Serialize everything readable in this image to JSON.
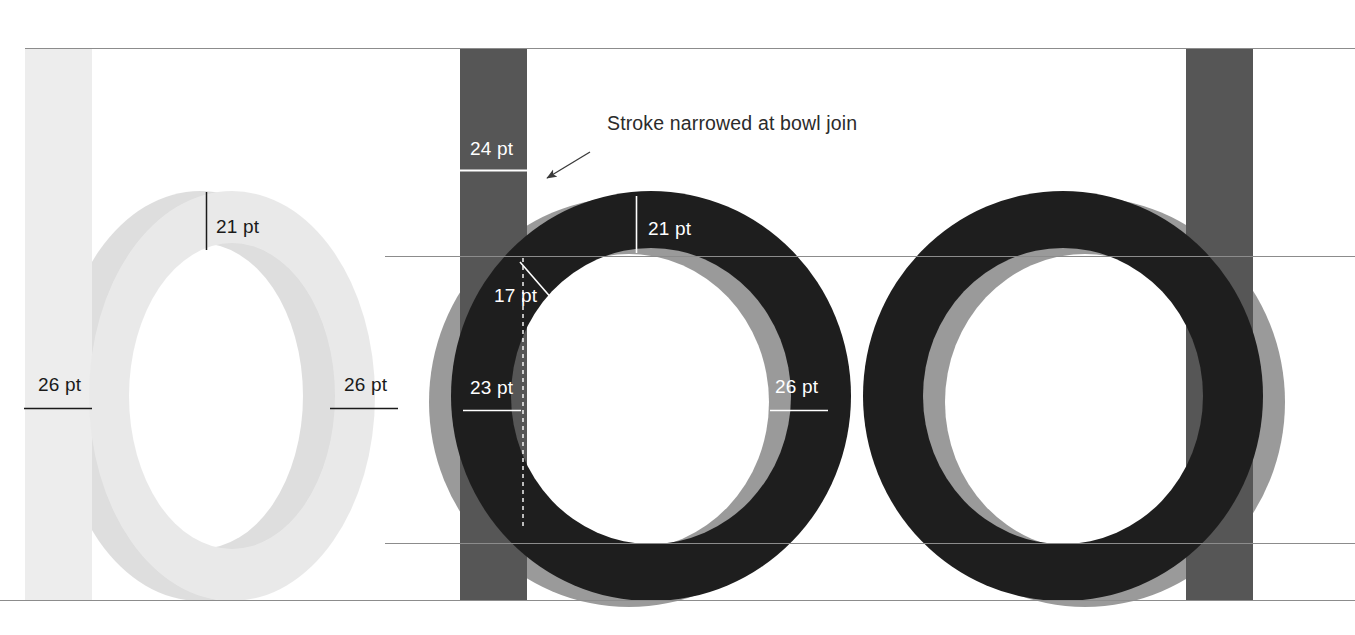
{
  "figure": {
    "background": "#ffffff"
  },
  "colors": {
    "page_background": "#ffffff",
    "light_letter": "#e9e9e9",
    "light_letter_ghost": "#dedede",
    "dark_letter": "#1e1e1e",
    "dark_letter_ghost": "#9a9a9a",
    "bar_light": "#ededed",
    "bar_dark": "#565656",
    "guideline": "#8c8c8c",
    "label_dark": "#1a1a1a",
    "label_light": "#ffffff",
    "annotation_text": "#2b2b2b",
    "annotation_arrow": "#3a3a3a"
  },
  "guidelines": [
    {
      "name": "cap-line",
      "y": 48,
      "x1": 25,
      "x2": 1355
    },
    {
      "name": "x-height-line",
      "y": 256,
      "x1": 385,
      "x2": 1355
    },
    {
      "name": "baseline",
      "y": 543,
      "x1": 385,
      "x2": 1355
    },
    {
      "name": "descender-line",
      "y": 600,
      "x1": 0,
      "x2": 1355
    }
  ],
  "vertical_bars": [
    {
      "name": "stem-bar-left",
      "x": 25,
      "width": 67,
      "y": 48,
      "height": 552,
      "tone": "light"
    },
    {
      "name": "stem-bar-middle",
      "x": 460,
      "width": 67,
      "y": 48,
      "height": 552,
      "tone": "dark"
    },
    {
      "name": "stem-bar-right",
      "x": 1186,
      "width": 67,
      "y": 48,
      "height": 552,
      "tone": "dark"
    }
  ],
  "letterforms": [
    {
      "name": "letter-o-light",
      "tone": "light",
      "cx": 232,
      "cy": 396,
      "rx_outer": 143,
      "ry_outer": 205,
      "rx_inner": 103,
      "ry_inner": 153,
      "ghost_dx": -32,
      "ghost_dy": 0,
      "has_ghost": true
    },
    {
      "name": "letter-o-dark-measured",
      "tone": "dark",
      "cx": 651,
      "cy": 396,
      "rx_outer": 200,
      "ry_outer": 205,
      "rx_inner": 140,
      "ry_inner": 148,
      "ghost_dx": -22,
      "ghost_dy": 6,
      "has_ghost": true
    },
    {
      "name": "letter-o-dark-plain",
      "tone": "dark",
      "cx": 1063,
      "cy": 396,
      "rx_outer": 200,
      "ry_outer": 205,
      "rx_inner": 140,
      "ry_inner": 148,
      "ghost_dx": 22,
      "ghost_dy": 6,
      "has_ghost": true
    }
  ],
  "measurements": [
    {
      "name": "measure-light-top",
      "value": "21 pt",
      "tone": "dark",
      "tick": {
        "orientation": "vertical",
        "x": 206,
        "y1": 192,
        "y2": 250
      },
      "text_x": 216,
      "text_y": 233
    },
    {
      "name": "measure-light-left",
      "value": "26 pt",
      "tone": "dark",
      "tick": {
        "orientation": "horizontal",
        "y": 408,
        "x1": 24,
        "x2": 92
      },
      "text_x": 38,
      "text_y": 391
    },
    {
      "name": "measure-light-right",
      "value": "26 pt",
      "tone": "dark",
      "tick": {
        "orientation": "horizontal",
        "y": 408,
        "x1": 330,
        "x2": 398
      },
      "text_x": 344,
      "text_y": 391
    },
    {
      "name": "measure-dark-stem-top",
      "value": "24 pt",
      "tone": "light",
      "tick": {
        "orientation": "horizontal",
        "y": 170,
        "x1": 460,
        "x2": 527
      },
      "text_x": 470,
      "text_y": 155
    },
    {
      "name": "measure-dark-top",
      "value": "21 pt",
      "tone": "light",
      "tick": {
        "orientation": "vertical",
        "x": 636,
        "y1": 196,
        "y2": 253
      },
      "text_x": 648,
      "text_y": 235
    },
    {
      "name": "measure-dark-bowl-join",
      "value": "17 pt",
      "tone": "light",
      "tick": {
        "orientation": "diagonal",
        "x1": 520,
        "y1": 262,
        "x2": 553,
        "y2": 300
      },
      "text_x": 494,
      "text_y": 302
    },
    {
      "name": "measure-dark-left",
      "value": "23 pt",
      "tone": "light",
      "tick": {
        "orientation": "horizontal",
        "y": 410,
        "x1": 463,
        "x2": 521
      },
      "text_x": 470,
      "text_y": 394
    },
    {
      "name": "measure-dark-right",
      "value": "26 pt",
      "tone": "light",
      "tick": {
        "orientation": "horizontal",
        "y": 410,
        "x1": 770,
        "x2": 828
      },
      "text_x": 775,
      "text_y": 393
    }
  ],
  "dashed_guide": {
    "name": "bowl-join-dashed-line",
    "x": 523,
    "y1": 258,
    "y2": 530
  },
  "annotation": {
    "name": "stroke-narrowed-callout",
    "text": "Stroke narrowed at bowl join",
    "text_x": 607,
    "text_y": 130,
    "arrow": {
      "x1": 590,
      "y1": 152,
      "x2": 544,
      "y2": 180
    }
  }
}
